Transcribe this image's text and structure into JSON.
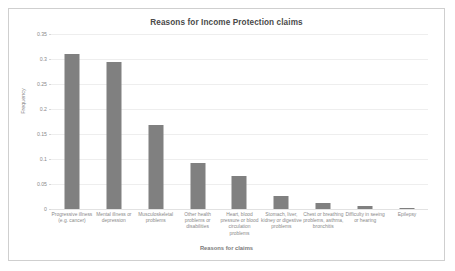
{
  "chart_data": {
    "type": "bar",
    "title": "Reasons for Income Protection claims",
    "xlabel": "Reasons for claims",
    "ylabel": "Frequency",
    "categories": [
      "Progressive illness (e.g. cancer)",
      "Mental illness or depression",
      "Musculoskeletal problems",
      "Other health problems or disabilities",
      "Heart, blood pressure or blood circulation problems",
      "Stomach, liver, kidney or digestive problems",
      "Chest or breathing problems, asthma, bronchitis",
      "Difficulty in seeing or hearing",
      "Epilepsy"
    ],
    "values": [
      0.31,
      0.295,
      0.168,
      0.093,
      0.067,
      0.027,
      0.012,
      0.007,
      0.002
    ],
    "ylim": [
      0,
      0.35
    ],
    "yticks": [
      "0.35",
      "0.3",
      "0.25",
      "0.2",
      "0.15",
      "0.1",
      "0.05",
      "0"
    ],
    "ytick_values": [
      0.35,
      0.3,
      0.25,
      0.2,
      0.15,
      0.1,
      0.05,
      0
    ],
    "grid": true,
    "legend": false,
    "bar_color": "#808080",
    "grid_color": "#eeeeee",
    "text_color": "#8a8a8a",
    "border_color": "#cfcfcf",
    "background": "#ffffff"
  }
}
